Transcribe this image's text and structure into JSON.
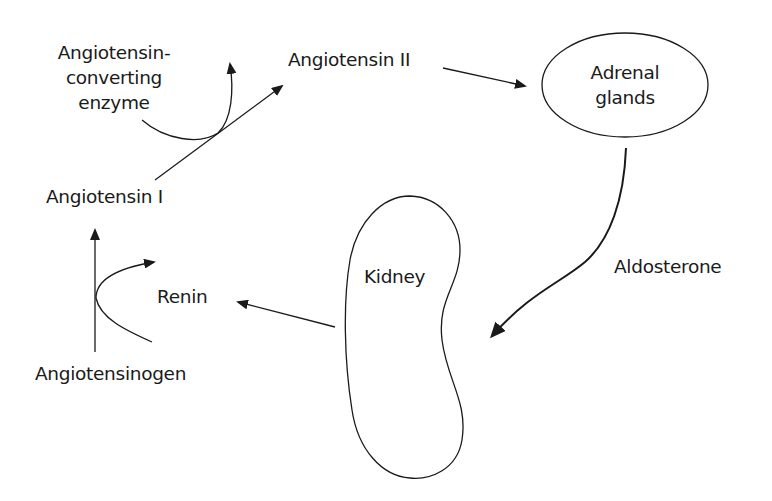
{
  "nodes": {
    "ace": {
      "line1": "Angiotensin-",
      "line2": "converting",
      "line3": "enzyme"
    },
    "angiotensin_ii": "Angiotensin II",
    "angiotensin_i": "Angiotensin I",
    "angiotensinogen": "Angiotensinogen",
    "renin": "Renin",
    "kidney": "Kidney",
    "adrenal": {
      "line1": "Adrenal",
      "line2": "glands"
    },
    "aldosterone": "Aldosterone"
  },
  "edges": [
    {
      "from": "Angiotensinogen",
      "to": "Angiotensin I",
      "via": "Renin"
    },
    {
      "from": "Angiotensin I",
      "to": "Angiotensin II",
      "via": "Angiotensin-converting enzyme"
    },
    {
      "from": "Angiotensin II",
      "to": "Adrenal glands"
    },
    {
      "from": "Adrenal glands",
      "to": "Kidney",
      "label": "Aldosterone"
    },
    {
      "from": "Kidney",
      "to": "Renin"
    }
  ],
  "colors": {
    "stroke": "#1a1a1a",
    "background": "#ffffff"
  }
}
